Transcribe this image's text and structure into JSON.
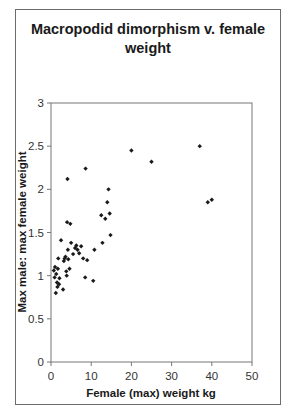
{
  "chart_data": {
    "type": "scatter",
    "title": "Macropodid dimorphism v. female weight",
    "xlabel": "Female (max) weight kg",
    "ylabel": "Max male: max female weight",
    "xlim": [
      0,
      50
    ],
    "ylim": [
      0,
      3
    ],
    "xticks": [
      0,
      10,
      20,
      30,
      40,
      50
    ],
    "yticks": [
      0,
      0.5,
      1,
      1.5,
      2,
      2.5,
      3
    ],
    "ytick_labels": [
      "0",
      "0.5",
      "1",
      "1.5",
      "2",
      "2.5",
      "3"
    ],
    "grid": false,
    "legend": null,
    "marker": "diamond",
    "marker_color": "#1a1a1a",
    "points": [
      {
        "x": 0.7,
        "y": 1.06
      },
      {
        "x": 0.9,
        "y": 0.98
      },
      {
        "x": 1.0,
        "y": 1.1
      },
      {
        "x": 1.2,
        "y": 0.8
      },
      {
        "x": 1.3,
        "y": 1.02
      },
      {
        "x": 1.5,
        "y": 0.92
      },
      {
        "x": 1.6,
        "y": 0.87
      },
      {
        "x": 1.7,
        "y": 1.08
      },
      {
        "x": 1.8,
        "y": 1.2
      },
      {
        "x": 2.0,
        "y": 0.9
      },
      {
        "x": 2.1,
        "y": 0.97
      },
      {
        "x": 2.5,
        "y": 1.41
      },
      {
        "x": 3.0,
        "y": 0.84
      },
      {
        "x": 3.2,
        "y": 1.17
      },
      {
        "x": 3.4,
        "y": 1.2
      },
      {
        "x": 3.6,
        "y": 1.22
      },
      {
        "x": 3.8,
        "y": 1.05
      },
      {
        "x": 3.9,
        "y": 1.0
      },
      {
        "x": 4.0,
        "y": 1.62
      },
      {
        "x": 4.1,
        "y": 2.12
      },
      {
        "x": 4.2,
        "y": 1.3
      },
      {
        "x": 4.3,
        "y": 1.19
      },
      {
        "x": 4.6,
        "y": 1.08
      },
      {
        "x": 4.8,
        "y": 1.6
      },
      {
        "x": 5.0,
        "y": 1.38
      },
      {
        "x": 5.5,
        "y": 1.25
      },
      {
        "x": 6.0,
        "y": 1.32
      },
      {
        "x": 6.3,
        "y": 1.35
      },
      {
        "x": 6.6,
        "y": 1.3
      },
      {
        "x": 7.0,
        "y": 1.26
      },
      {
        "x": 7.5,
        "y": 1.34
      },
      {
        "x": 8.0,
        "y": 1.2
      },
      {
        "x": 8.5,
        "y": 0.98
      },
      {
        "x": 8.6,
        "y": 2.24
      },
      {
        "x": 9.0,
        "y": 1.18
      },
      {
        "x": 10.5,
        "y": 0.94
      },
      {
        "x": 10.8,
        "y": 1.3
      },
      {
        "x": 12.5,
        "y": 1.7
      },
      {
        "x": 12.8,
        "y": 1.38
      },
      {
        "x": 13.5,
        "y": 1.66
      },
      {
        "x": 14.0,
        "y": 1.85
      },
      {
        "x": 14.3,
        "y": 2.0
      },
      {
        "x": 14.6,
        "y": 1.72
      },
      {
        "x": 14.8,
        "y": 1.47
      },
      {
        "x": 20.0,
        "y": 2.45
      },
      {
        "x": 25.0,
        "y": 2.32
      },
      {
        "x": 37.0,
        "y": 2.5
      },
      {
        "x": 39.0,
        "y": 1.85
      },
      {
        "x": 40.0,
        "y": 1.88
      }
    ]
  }
}
